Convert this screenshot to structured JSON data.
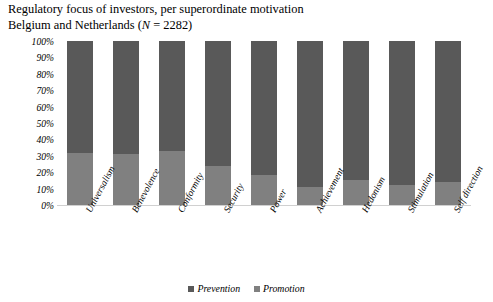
{
  "title": {
    "line1": "Regulatory focus of investors, per superordinate motivation",
    "line2_pre": "Belgium and Netherlands (",
    "line2_italic": "N",
    "line2_post": " = 2282)"
  },
  "legend": {
    "position": "bottom-center",
    "items": [
      {
        "label": "Prevention",
        "color": "#595959"
      },
      {
        "label": "Promotion",
        "color": "#808080"
      }
    ]
  },
  "chart_data": {
    "type": "bar",
    "subtype": "stacked-100-percent",
    "xlabel": "",
    "ylabel": "",
    "ylim": [
      0,
      100
    ],
    "grid": false,
    "categories": [
      "Universalism",
      "Benevolence",
      "Conformity",
      "Security",
      "Power",
      "Achievement",
      "Hedonism",
      "Stimulation",
      "Self direction"
    ],
    "ytick_labels": [
      "100%",
      "90%",
      "80%",
      "70%",
      "60%",
      "50%",
      "40%",
      "30%",
      "20%",
      "10%",
      "0%"
    ],
    "ytick_values": [
      100,
      90,
      80,
      70,
      60,
      50,
      40,
      30,
      20,
      10,
      0
    ],
    "series": [
      {
        "name": "Prevention",
        "color": "#595959",
        "values": [
          68,
          69,
          67,
          76,
          82,
          89,
          85,
          88,
          86
        ]
      },
      {
        "name": "Promotion",
        "color": "#808080",
        "values": [
          32,
          31,
          33,
          24,
          18,
          11,
          15,
          12,
          14
        ]
      }
    ]
  }
}
